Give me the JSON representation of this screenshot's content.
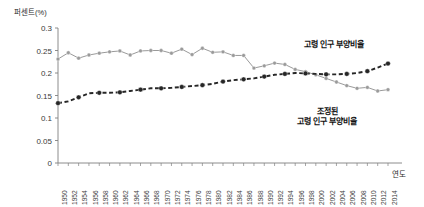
{
  "chart_data": {
    "type": "line",
    "title": "",
    "ylabel": "퍼센트(%)",
    "xlabel": "연도",
    "ylim": [
      0,
      0.3
    ],
    "yticks": [
      "0",
      "0.05",
      "0.1",
      "0.15",
      "0.2",
      "0.25",
      "0.3"
    ],
    "ytick_values": [
      0,
      0.05,
      0.1,
      0.15,
      0.2,
      0.25,
      0.3
    ],
    "grid": false,
    "legend_position": "inline-annotation",
    "x": [
      1950,
      1952,
      1954,
      1956,
      1958,
      1960,
      1962,
      1964,
      1966,
      1968,
      1970,
      1972,
      1974,
      1976,
      1978,
      1980,
      1982,
      1984,
      1986,
      1988,
      1990,
      1992,
      1994,
      1996,
      1998,
      2000,
      2002,
      2004,
      2006,
      2008,
      2010,
      2012,
      2014
    ],
    "categories": [
      "1950",
      "1952",
      "1954",
      "1956",
      "1958",
      "1960",
      "1962",
      "1964",
      "1966",
      "1968",
      "1970",
      "1972",
      "1974",
      "1976",
      "1978",
      "1980",
      "1982",
      "1984",
      "1986",
      "1988",
      "1990",
      "1992",
      "1994",
      "1996",
      "1998",
      "2000",
      "2002",
      "2004",
      "2006",
      "2008",
      "2010",
      "2012",
      "2014"
    ],
    "series": [
      {
        "name": "고령 인구 부양비율",
        "style": "solid",
        "color": "#9a9a9a",
        "marker": "circle",
        "values": [
          0.231,
          0.245,
          0.233,
          0.24,
          0.244,
          0.247,
          0.249,
          0.24,
          0.249,
          0.25,
          0.25,
          0.244,
          0.253,
          0.241,
          0.255,
          0.246,
          0.247,
          0.239,
          0.239,
          0.211,
          0.216,
          0.222,
          0.219,
          0.208,
          0.203,
          0.196,
          0.188,
          0.18,
          0.172,
          0.166,
          0.168,
          0.16,
          0.163
        ]
      },
      {
        "name": "조정된 고령 인구 부양비율",
        "style": "dashed",
        "color": "#262626",
        "marker": "circle",
        "values": [
          0.133,
          0.137,
          0.146,
          0.155,
          0.156,
          0.156,
          0.157,
          0.16,
          0.163,
          0.166,
          0.166,
          0.167,
          0.169,
          0.171,
          0.173,
          0.176,
          0.181,
          0.184,
          0.186,
          0.188,
          0.192,
          0.196,
          0.198,
          0.2,
          0.199,
          0.198,
          0.197,
          0.197,
          0.198,
          0.2,
          0.204,
          0.212,
          0.221
        ]
      }
    ],
    "annotations": [
      {
        "id": "aged",
        "text": "고령 인구 부양비율"
      },
      {
        "id": "adjusted_line1",
        "text": "조정된"
      },
      {
        "id": "adjusted_line2",
        "text": "고령 인구 부양비율"
      }
    ]
  },
  "axis": {
    "ylabel": "퍼센트(%)",
    "xlabel": "연도"
  },
  "colors": {
    "series_aged": "#9a9a9a",
    "series_adjusted": "#262626",
    "axis": "#808080",
    "text": "#333333"
  }
}
